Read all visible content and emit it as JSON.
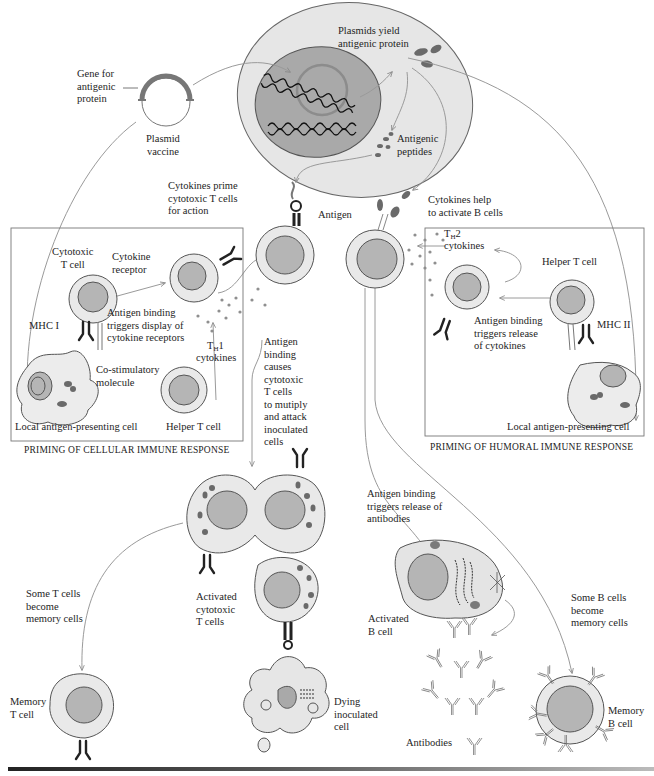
{
  "diagram": {
    "topic": "Plasmid (DNA) vaccine immune response",
    "colors": {
      "cytoplasm": "#e6e6e6",
      "nucleus_large": "#a9a9a9",
      "cell_body": "#e9e9e9",
      "cell_nucleus": "#b5b5b5",
      "arrow": "#9a9a9a",
      "outline": "#555555",
      "receptor": "#222222",
      "protein": "#6e6e6e"
    },
    "labels": {
      "gene_for_antigenic_protein": "Gene for\nantigenic\nprotein",
      "plasmid_vaccine": "Plasmid\nvaccine",
      "plasmids_yield": "Plasmids yield\nantigenic protein",
      "antigenic_peptides": "Antigenic\npeptides",
      "cytokines_prime": "Cytokines prime\ncytotoxic T cells\nfor action",
      "antigen": "Antigen",
      "cytokines_help": "Cytokines help\nto activate B cells",
      "cytotoxic_t_cell": "Cytotoxic\nT cell",
      "cytokine_receptor": "Cytokine\nreceptor",
      "antigen_binding_display": "Antigen binding\ntriggers display of\ncytokine receptors",
      "mhc_i": "MHC I",
      "th1_cytokines_main": "T",
      "th1_sub": "H",
      "th1_rest": "1",
      "th1_cytokines_word": "cytokines",
      "co_stimulatory": "Co-stimulatory\nmolecule",
      "local_apc_left": "Local antigen-presenting cell",
      "helper_t_cell_left": "Helper T cell",
      "priming_cellular": "PRIMING OF CELLULAR IMMUNE RESPONSE",
      "antigen_binding_causes": "Antigen\nbinding\ncauses\ncytotoxic\nT cells\nto mutiply\nand attack\ninoculated\ncells",
      "th2_main": "T",
      "th2_sub": "H",
      "th2_rest": "2",
      "th2_cytokines_word": "cytokines",
      "helper_t_cell_right": "Helper T cell",
      "antigen_binding_release_cytokines": "Antigen binding\ntriggers release\nof cytokines",
      "mhc_ii": "MHC II",
      "local_apc_right": "Local antigen-presenting cell",
      "priming_humoral": "PRIMING OF HUMORAL IMMUNE RESPONSE",
      "antigen_binding_antibodies": "Antigen binding\ntriggers release of\nantibodies",
      "some_t_cells_memory": "Some T cells\nbecome\nmemory cells",
      "activated_cytotoxic_t": "Activated\ncytotoxic\nT cells",
      "activated_b_cell": "Activated\nB cell",
      "some_b_cells_memory": "Some B cells\nbecome\nmemory cells",
      "memory_t_cell": "Memory\nT cell",
      "dying_inoculated_cell": "Dying\ninoculated\ncell",
      "antibodies": "Antibodies",
      "memory_b_cell": "Memory\nB cell"
    }
  }
}
